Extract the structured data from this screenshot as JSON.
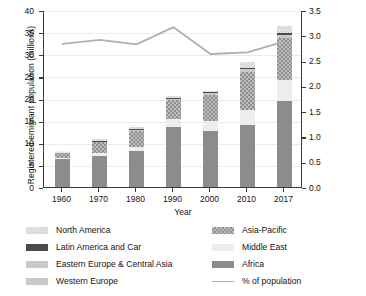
{
  "chart_data": {
    "type": "bar",
    "title": "",
    "xlabel": "Year",
    "ylabel": "Registered emigrant population (millions)",
    "ylabel_right": "Registered emigrant population (%)",
    "categories": [
      "1960",
      "1970",
      "1980",
      "1990",
      "2000",
      "2010",
      "2017"
    ],
    "ylim": [
      0,
      40
    ],
    "yticks": [
      "0",
      "5",
      "10",
      "15",
      "20",
      "25",
      "30",
      "35",
      "40"
    ],
    "ylim_right": [
      0,
      3.5
    ],
    "yticks_right": [
      "0.0",
      "0.5",
      "1.0",
      "1.5",
      "2.0",
      "2.5",
      "3.0",
      "3.5"
    ],
    "grid": true,
    "stacked": true,
    "legend_position": "below",
    "series": [
      {
        "name": "Africa",
        "pattern": "solid-dark-gray",
        "color": "#8c8c8c",
        "values": [
          6.3,
          7.1,
          8.1,
          13.5,
          12.6,
          14.0,
          19.5
        ]
      },
      {
        "name": "Middle East",
        "pattern": "solid-light",
        "color": "#ededed",
        "values": [
          0.3,
          0.5,
          0.9,
          1.9,
          2.3,
          3.5,
          4.6
        ]
      },
      {
        "name": "Asia-Pacific",
        "pattern": "checker-medium",
        "color": "#bdbdbd",
        "values": [
          1.3,
          2.6,
          3.6,
          4.3,
          5.9,
          8.5,
          9.5
        ]
      },
      {
        "name": "Eastern Europe & Central Asia",
        "pattern": "checker-fine",
        "color": "#e3e3e3",
        "values": [
          0.1,
          0.1,
          0.2,
          0.2,
          0.3,
          0.4,
          0.4
        ]
      },
      {
        "name": "Western Europe",
        "pattern": "solid-mid-light",
        "color": "#c9c9c9",
        "values": [
          0.1,
          0.1,
          0.2,
          0.2,
          0.2,
          0.3,
          0.4
        ]
      },
      {
        "name": "Latin America and Car",
        "pattern": "solid-very-dark",
        "color": "#4a4a4a",
        "values": [
          0.05,
          0.1,
          0.1,
          0.1,
          0.2,
          0.2,
          0.3
        ]
      },
      {
        "name": "North America",
        "pattern": "checker-light",
        "color": "#f0f0f0",
        "values": [
          0.1,
          0.3,
          0.5,
          0.4,
          0.3,
          1.4,
          1.6
        ]
      }
    ],
    "line_series": {
      "name": "% of population",
      "color": "#b0b0b0",
      "axis": "right",
      "values": [
        2.85,
        2.93,
        2.84,
        3.18,
        2.65,
        2.68,
        2.9
      ]
    }
  },
  "legend": {
    "left": [
      {
        "label": "North America",
        "swatch": "f-northamerica"
      },
      {
        "label": "Latin America and Car",
        "swatch": "f-latinamerica"
      },
      {
        "label": "Eastern Europe & Central Asia",
        "swatch": "f-easterneurope"
      },
      {
        "label": "Western Europe",
        "swatch": "f-westerneurope"
      }
    ],
    "right": [
      {
        "label": "Asia-Pacific",
        "swatch": "f-asiapacific"
      },
      {
        "label": "Middle East",
        "swatch": "f-middleeast"
      },
      {
        "label": "Africa",
        "swatch": "f-africa"
      },
      {
        "label": "% of population",
        "swatch": "line"
      }
    ]
  }
}
